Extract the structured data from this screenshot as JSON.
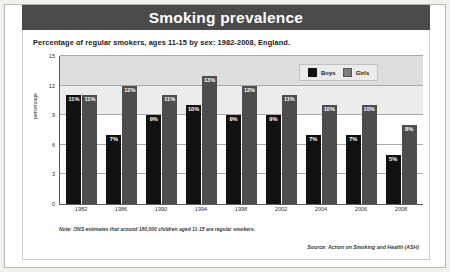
{
  "header": {
    "title": "Smoking prevalence"
  },
  "subtitle": "Percentage of regular smokers, ages 11-15 by sex: 1982-2008, England.",
  "legend": {
    "boys_label": "Boys",
    "girls_label": "Girls"
  },
  "note": "Note: ONS estimates that around 180,000 children aged 11-15 are regular smokers.",
  "source": "Source: Action on Smoking and Health (ASH)",
  "colors": {
    "title_bar": "#4a4a4a",
    "boys": "#111111",
    "girls": "#4d4d4d",
    "band": "#dedede",
    "page": "#f2f1ee"
  },
  "chart_data": {
    "type": "bar",
    "title": "Smoking prevalence",
    "subtitle": "Percentage of regular smokers, ages 11-15 by sex: 1982-2008, England.",
    "xlabel": "",
    "ylabel": "percentage",
    "ylim": [
      0,
      15
    ],
    "yticks": [
      0,
      3,
      6,
      9,
      12,
      15
    ],
    "ytick_labels": [
      "0",
      "3",
      "6",
      "9",
      "12",
      "15"
    ],
    "grid": true,
    "legend_position": "top-right",
    "categories": [
      "1982",
      "1986",
      "1990",
      "1994",
      "1998",
      "2002",
      "2004",
      "2006",
      "2008"
    ],
    "series": [
      {
        "name": "Boys",
        "color": "#111111",
        "values": [
          11,
          7,
          9,
          10,
          9,
          9,
          7,
          7,
          5
        ],
        "labels": [
          "11%",
          "7%",
          "9%",
          "10%",
          "9%",
          "9%",
          "7%",
          "7%",
          "5%"
        ]
      },
      {
        "name": "Girls",
        "color": "#4d4d4d",
        "values": [
          11,
          12,
          11,
          13,
          12,
          11,
          10,
          10,
          8
        ],
        "labels": [
          "11%",
          "12%",
          "11%",
          "13%",
          "12%",
          "11%",
          "10%",
          "10%",
          "8%"
        ]
      }
    ],
    "note": "Note: ONS estimates that around 180,000 children aged 11-15 are regular smokers.",
    "source": "Source: Action on Smoking and Health (ASH)"
  }
}
